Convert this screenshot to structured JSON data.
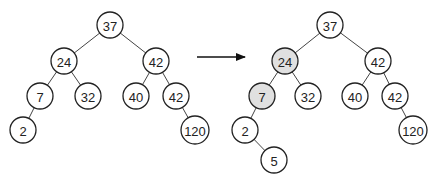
{
  "colors": {
    "node_fill": "#ffffff",
    "highlight_fill": "#e0e0e0",
    "stroke": "#222222",
    "edge": "#444444"
  },
  "diagram": {
    "arrow": {
      "x1": 197,
      "y1": 57,
      "x2": 245,
      "y2": 57
    },
    "trees": [
      {
        "name": "before",
        "nodes": [
          {
            "id": "a",
            "label": "37",
            "x": 110,
            "y": 25,
            "highlight": false
          },
          {
            "id": "b",
            "label": "24",
            "x": 64,
            "y": 61,
            "highlight": false
          },
          {
            "id": "c",
            "label": "42",
            "x": 156,
            "y": 61,
            "highlight": false
          },
          {
            "id": "d",
            "label": "7",
            "x": 40,
            "y": 96,
            "highlight": false
          },
          {
            "id": "e",
            "label": "32",
            "x": 88,
            "y": 96,
            "highlight": false
          },
          {
            "id": "f",
            "label": "40",
            "x": 136,
            "y": 96,
            "highlight": false
          },
          {
            "id": "g",
            "label": "42",
            "x": 176,
            "y": 96,
            "highlight": false
          },
          {
            "id": "h",
            "label": "2",
            "x": 23,
            "y": 130,
            "highlight": false
          },
          {
            "id": "i",
            "label": "120",
            "x": 195,
            "y": 130,
            "highlight": false
          }
        ],
        "edges": [
          [
            "a",
            "b"
          ],
          [
            "a",
            "c"
          ],
          [
            "b",
            "d"
          ],
          [
            "b",
            "e"
          ],
          [
            "c",
            "f"
          ],
          [
            "c",
            "g"
          ],
          [
            "d",
            "h"
          ],
          [
            "g",
            "i"
          ]
        ]
      },
      {
        "name": "after",
        "nodes": [
          {
            "id": "a",
            "label": "37",
            "x": 330,
            "y": 25,
            "highlight": false
          },
          {
            "id": "b",
            "label": "24",
            "x": 285,
            "y": 61,
            "highlight": true
          },
          {
            "id": "c",
            "label": "42",
            "x": 378,
            "y": 61,
            "highlight": false
          },
          {
            "id": "d",
            "label": "7",
            "x": 262,
            "y": 96,
            "highlight": true
          },
          {
            "id": "e",
            "label": "32",
            "x": 308,
            "y": 96,
            "highlight": false
          },
          {
            "id": "f",
            "label": "40",
            "x": 355,
            "y": 96,
            "highlight": false
          },
          {
            "id": "g",
            "label": "42",
            "x": 395,
            "y": 96,
            "highlight": false
          },
          {
            "id": "h",
            "label": "2",
            "x": 245,
            "y": 130,
            "highlight": false
          },
          {
            "id": "i",
            "label": "120",
            "x": 413,
            "y": 130,
            "highlight": false
          },
          {
            "id": "j",
            "label": "5",
            "x": 274,
            "y": 160,
            "highlight": false
          }
        ],
        "edges": [
          [
            "a",
            "b"
          ],
          [
            "a",
            "c"
          ],
          [
            "b",
            "d"
          ],
          [
            "b",
            "e"
          ],
          [
            "c",
            "f"
          ],
          [
            "c",
            "g"
          ],
          [
            "d",
            "h"
          ],
          [
            "g",
            "i"
          ],
          [
            "h",
            "j"
          ]
        ]
      }
    ]
  }
}
